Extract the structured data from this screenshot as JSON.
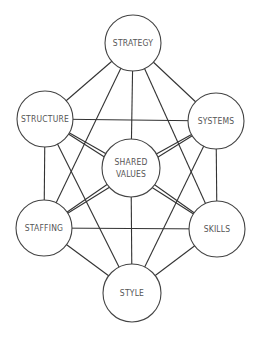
{
  "diagram": {
    "title": "",
    "nodes": [
      {
        "id": "strategy",
        "label": "STRATEGY",
        "cx": 133,
        "cy": 43,
        "r": 28
      },
      {
        "id": "structure",
        "label": "STRUCTURE",
        "cx": 45,
        "cy": 119,
        "r": 28
      },
      {
        "id": "systems",
        "label": "SYSTEMS",
        "cx": 216,
        "cy": 121,
        "r": 28
      },
      {
        "id": "shared_values",
        "label": "SHARED VALUES",
        "lines": [
          "SHARED",
          "VALUES"
        ],
        "cx": 131,
        "cy": 168,
        "r": 29
      },
      {
        "id": "staffing",
        "label": "STAFFING",
        "cx": 44,
        "cy": 228,
        "r": 28
      },
      {
        "id": "skills",
        "label": "SKILLS",
        "cx": 217,
        "cy": 229,
        "r": 28
      },
      {
        "id": "style",
        "label": "STYLE",
        "cx": 132,
        "cy": 293,
        "r": 29
      }
    ],
    "edges": [
      [
        "strategy",
        "structure"
      ],
      [
        "strategy",
        "systems"
      ],
      [
        "strategy",
        "shared_values"
      ],
      [
        "strategy",
        "staffing"
      ],
      [
        "strategy",
        "skills"
      ],
      [
        "structure",
        "systems"
      ],
      [
        "structure",
        "shared_values"
      ],
      [
        "structure",
        "staffing"
      ],
      [
        "structure",
        "skills"
      ],
      [
        "structure",
        "style"
      ],
      [
        "systems",
        "shared_values"
      ],
      [
        "systems",
        "staffing"
      ],
      [
        "systems",
        "skills"
      ],
      [
        "systems",
        "style"
      ],
      [
        "shared_values",
        "staffing"
      ],
      [
        "shared_values",
        "skills"
      ],
      [
        "shared_values",
        "style"
      ],
      [
        "staffing",
        "skills"
      ],
      [
        "staffing",
        "style"
      ],
      [
        "skills",
        "style"
      ]
    ],
    "colors": {
      "line": "#333333",
      "circle_stroke": "#444444",
      "circle_fill": "#ffffff",
      "text": "#555555"
    }
  }
}
